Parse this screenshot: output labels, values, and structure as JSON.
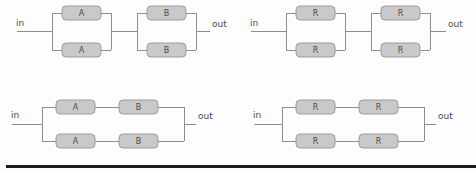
{
  "figure": {
    "background_color": "#fdfdfd",
    "wire_color": "#8e8e8e",
    "box_fill_color": "#c9c9c9",
    "box_stroke_color": "#9b9b9b",
    "label_color": "#4a4a4a",
    "rule_color": "#1a1a1a"
  },
  "ports": {
    "in_label": "in",
    "out_label": "out"
  },
  "diagrams": [
    {
      "id": "top-left",
      "topology": "series-of-two-parallel-pairs",
      "in_label": "in",
      "out_label": "out",
      "blocks": [
        {
          "label": "A",
          "branch": "upper",
          "stage": 1
        },
        {
          "label": "A",
          "branch": "lower",
          "stage": 1
        },
        {
          "label": "B",
          "branch": "upper",
          "stage": 2
        },
        {
          "label": "B",
          "branch": "lower",
          "stage": 2
        }
      ]
    },
    {
      "id": "top-right",
      "topology": "series-of-two-parallel-pairs",
      "in_label": "in",
      "out_label": "out",
      "blocks": [
        {
          "label": "R",
          "branch": "upper",
          "stage": 1
        },
        {
          "label": "R",
          "branch": "lower",
          "stage": 1
        },
        {
          "label": "R",
          "branch": "upper",
          "stage": 2
        },
        {
          "label": "R",
          "branch": "lower",
          "stage": 2
        }
      ]
    },
    {
      "id": "bottom-left",
      "topology": "parallel-of-two-series-chains",
      "in_label": "in",
      "out_label": "out",
      "blocks": [
        {
          "label": "A",
          "branch": "upper",
          "stage": 1
        },
        {
          "label": "B",
          "branch": "upper",
          "stage": 2
        },
        {
          "label": "A",
          "branch": "lower",
          "stage": 1
        },
        {
          "label": "B",
          "branch": "lower",
          "stage": 2
        }
      ]
    },
    {
      "id": "bottom-right",
      "topology": "parallel-of-two-series-chains",
      "in_label": "in",
      "out_label": "out",
      "blocks": [
        {
          "label": "R",
          "branch": "upper",
          "stage": 1
        },
        {
          "label": "R",
          "branch": "upper",
          "stage": 2
        },
        {
          "label": "R",
          "branch": "lower",
          "stage": 1
        },
        {
          "label": "R",
          "branch": "lower",
          "stage": 2
        }
      ]
    }
  ]
}
